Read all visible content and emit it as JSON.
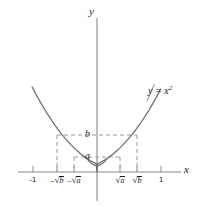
{
  "figure": {
    "background_color": "#ffffff",
    "curve_color": "#6f6f6f",
    "axis_color": "#8a8a8a",
    "dash_color": "#9a9a9a",
    "text_color": "#1a1a1a"
  },
  "axes": {
    "y_axis_label": "y",
    "x_axis_label": "x"
  },
  "value_labels": {
    "a": "a",
    "b": "b"
  },
  "curve_label": {
    "lhs": "y = x",
    "exponent": "2",
    "full": "y = x²"
  },
  "x_ticks": [
    {
      "id": "neg-one",
      "label": "-1",
      "surd": false,
      "neg": true,
      "radicand": "",
      "x": 33
    },
    {
      "id": "neg-sqrt-b",
      "label": "-√b",
      "surd": true,
      "neg": true,
      "radicand": "b",
      "x": 57
    },
    {
      "id": "neg-sqrt-a",
      "label": "-√a",
      "surd": true,
      "neg": true,
      "radicand": "a",
      "x": 74
    },
    {
      "id": "sqrt-a",
      "label": "√a",
      "surd": true,
      "neg": false,
      "radicand": "a",
      "x": 120
    },
    {
      "id": "sqrt-b",
      "label": "√b",
      "surd": true,
      "neg": false,
      "radicand": "b",
      "x": 137
    },
    {
      "id": "one",
      "label": "1",
      "surd": false,
      "neg": false,
      "radicand": "",
      "x": 161
    }
  ],
  "chart_data": {
    "type": "line",
    "title": "",
    "xlabel": "x",
    "ylabel": "y",
    "function": "y = x^2",
    "series": [
      {
        "name": "y = x²",
        "x": [
          -0.95,
          -0.8,
          -0.6,
          -0.4,
          -0.2,
          0,
          0.2,
          0.4,
          0.6,
          0.8,
          0.95
        ],
        "values": [
          0.9025,
          0.64,
          0.36,
          0.16,
          0.04,
          0,
          0.04,
          0.16,
          0.36,
          0.64,
          0.9025
        ]
      }
    ],
    "xlim": [
      -1.25,
      1.15
    ],
    "ylim": [
      -0.2,
      1.15
    ],
    "grid": false,
    "legend": "none",
    "annotations": [
      {
        "text": "y = x²",
        "x": 0.82,
        "y": 0.62
      },
      {
        "text": "a",
        "x": -0.06,
        "y": 0.115
      },
      {
        "text": "b",
        "x": -0.06,
        "y": 0.275
      }
    ],
    "xticks": [
      -1,
      -0.79,
      -0.46,
      0.46,
      0.79,
      1
    ],
    "xticklabels": [
      "-1",
      "-√b",
      "-√a",
      "√a",
      "√b",
      "1"
    ],
    "yticks": [],
    "yticklabels": [],
    "guide_lines": [
      {
        "id": "h-line-b",
        "orientation": "horizontal",
        "value": "b",
        "from_x": "-√b",
        "to_x": "√b",
        "style": "dashed"
      },
      {
        "id": "h-line-a",
        "orientation": "horizontal",
        "value": "a",
        "from_x": "-√a",
        "to_x": "√a",
        "style": "dashed"
      },
      {
        "id": "v-line-neg-sqrt-b",
        "orientation": "vertical",
        "value": "-√b",
        "style": "dashed"
      },
      {
        "id": "v-line-neg-sqrt-a",
        "orientation": "vertical",
        "value": "-√a",
        "style": "dashed"
      },
      {
        "id": "v-line-sqrt-a",
        "orientation": "vertical",
        "value": "√a",
        "style": "dashed"
      },
      {
        "id": "v-line-sqrt-b",
        "orientation": "vertical",
        "value": "√b",
        "style": "dashed"
      }
    ]
  }
}
